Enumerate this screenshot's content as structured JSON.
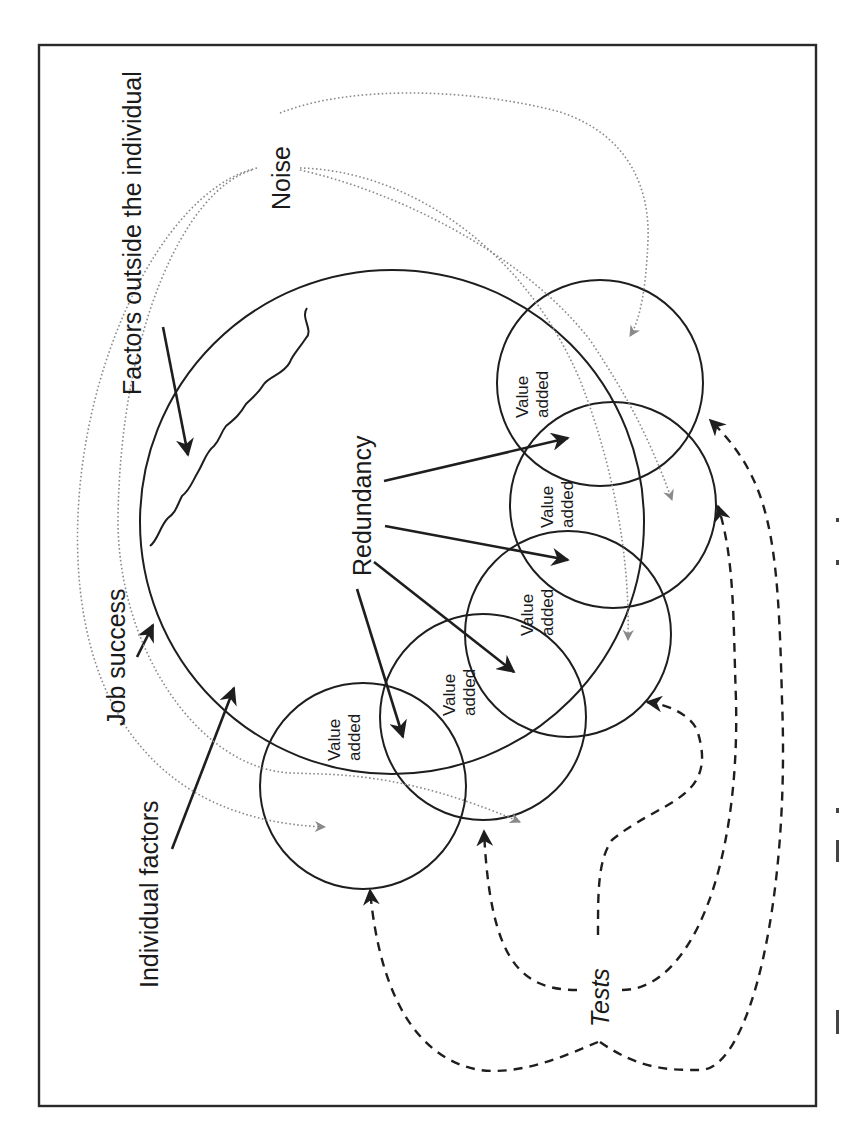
{
  "diagram": {
    "labels": {
      "factors_outside": "Factors outside the individual",
      "noise": "Noise",
      "job_success": "Job success",
      "redundancy": "Redundancy",
      "individual_factors": "Individual factors",
      "tests": "Tests"
    },
    "value_circles": [
      {
        "line1": "Value",
        "line2": "added"
      },
      {
        "line1": "Value",
        "line2": "added"
      },
      {
        "line1": "Value",
        "line2": "added"
      },
      {
        "line1": "Value",
        "line2": "added"
      },
      {
        "line1": "Value",
        "line2": "added"
      }
    ],
    "colors": {
      "line": "#1e1e1e",
      "noise_arrow": "#8a8a8a",
      "background": "#ffffff"
    },
    "orientation": "rotated -90deg (landscape figure on portrait page)"
  }
}
